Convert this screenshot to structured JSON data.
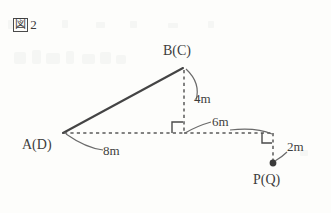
{
  "figure": {
    "caption_box_char": "図",
    "caption_number": "2"
  },
  "points": {
    "apex": "B(C)",
    "left": "A(D)",
    "right": "P(Q)"
  },
  "measurements": {
    "height": "4m",
    "right_run": "6m",
    "base": "8m",
    "drop": "2m"
  },
  "style": {
    "line_color": "#4a4a4a",
    "text_color": "#3d3d3d",
    "background": "#fdfdfb"
  }
}
